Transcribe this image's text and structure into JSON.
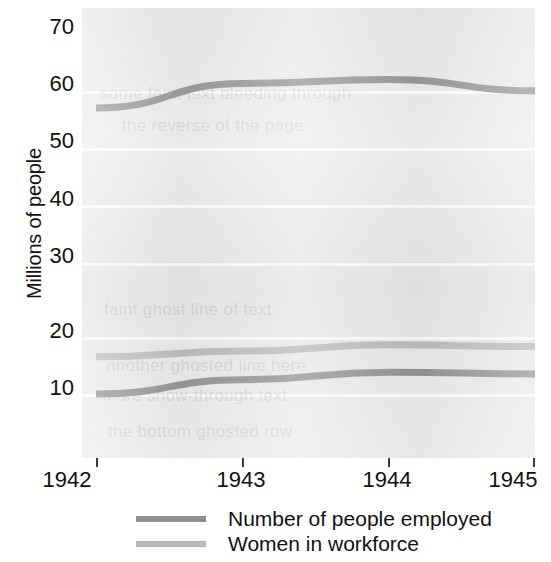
{
  "chart_data": {
    "type": "line",
    "title": "",
    "xlabel": "",
    "ylabel": "Millions of people",
    "x": [
      1942,
      1943,
      1944,
      1945
    ],
    "xticklabels": [
      "1942",
      "1943",
      "1944",
      "1945"
    ],
    "yticklabels": [
      "10",
      "20",
      "30",
      "40",
      "50",
      "60",
      "70"
    ],
    "yticks": [
      10,
      20,
      30,
      40,
      50,
      60,
      70
    ],
    "ylim": [
      0,
      72
    ],
    "xlim": [
      1942,
      1945
    ],
    "grid": "horizontal-white",
    "legend_position": "below-plot-left",
    "plot_background": "#e9e9e9",
    "series": [
      {
        "name": "Number of people employed",
        "color": "#8d8d8d",
        "values": [
          60.0,
          64.3,
          65.0,
          63.0
        ],
        "in_legend": true
      },
      {
        "name": "Women in workforce",
        "color": "#b9b9b9",
        "values": [
          16.5,
          17.5,
          18.6,
          18.3
        ],
        "in_legend": true
      },
      {
        "name": "Number of people employed (lower series)",
        "color": "#8d8d8d",
        "values": [
          10.0,
          12.5,
          13.8,
          13.5
        ],
        "in_legend": false
      }
    ]
  },
  "axes": {
    "y_title": "Millions of people",
    "y_ticks": [
      "70",
      "60",
      "50",
      "40",
      "30",
      "20",
      "10"
    ],
    "x_ticks": [
      "1942",
      "1943",
      "1944",
      "1945"
    ]
  },
  "legend": {
    "items": [
      {
        "label": "Number of people employed",
        "color": "#8d8d8d"
      },
      {
        "label": "Women in workforce",
        "color": "#b9b9b9"
      }
    ]
  },
  "ghost_text": {
    "a": "some faint text bleeding through",
    "b": "the reverse of the page",
    "c": "faint ghost line of text",
    "d": "another ghosted line here",
    "e": "more show-through text",
    "f": "the bottom ghosted row"
  }
}
